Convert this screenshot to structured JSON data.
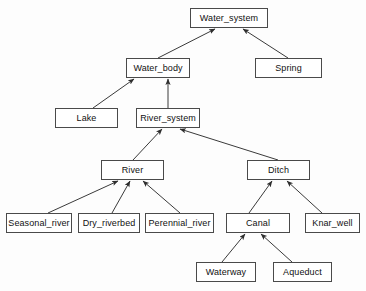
{
  "diagram": {
    "type": "hierarchy-tree",
    "background_color": "#fdfdfd",
    "box_fill_color": "#ffffff",
    "box_border_color": "#4a4a4a",
    "edge_color": "#3a3a3a",
    "text_color": "#111111",
    "arrow_direction": "child-to-parent",
    "nodes": [
      {
        "id": "water_system",
        "label": "Water_system",
        "x": 190,
        "y": 8,
        "w": 78,
        "h": 20,
        "level": 0
      },
      {
        "id": "water_body",
        "label": "Water_body",
        "x": 126,
        "y": 58,
        "w": 64,
        "h": 20,
        "level": 1
      },
      {
        "id": "spring",
        "label": "Spring",
        "x": 255,
        "y": 58,
        "w": 67,
        "h": 20,
        "level": 1
      },
      {
        "id": "lake",
        "label": "Lake",
        "x": 55,
        "y": 108,
        "w": 63,
        "h": 20,
        "level": 2
      },
      {
        "id": "river_system",
        "label": "River_system",
        "x": 136,
        "y": 108,
        "w": 64,
        "h": 20,
        "level": 2
      },
      {
        "id": "river",
        "label": "River",
        "x": 101,
        "y": 160,
        "w": 63,
        "h": 20,
        "level": 3
      },
      {
        "id": "ditch",
        "label": "Ditch",
        "x": 247,
        "y": 160,
        "w": 63,
        "h": 20,
        "level": 3
      },
      {
        "id": "seasonal_river",
        "label": "Seasonal_river",
        "x": 6,
        "y": 213,
        "w": 66,
        "h": 20,
        "level": 4
      },
      {
        "id": "dry_riverbed",
        "label": "Dry_riverbed",
        "x": 78,
        "y": 213,
        "w": 62,
        "h": 20,
        "level": 4
      },
      {
        "id": "perennial_river",
        "label": "Perennial_river",
        "x": 145,
        "y": 213,
        "w": 69,
        "h": 20,
        "level": 4
      },
      {
        "id": "canal",
        "label": "Canal",
        "x": 226,
        "y": 213,
        "w": 64,
        "h": 20,
        "level": 4
      },
      {
        "id": "knar_well",
        "label": "Knar_well",
        "x": 305,
        "y": 213,
        "w": 55,
        "h": 20,
        "level": 4
      },
      {
        "id": "waterway",
        "label": "Waterway",
        "x": 196,
        "y": 262,
        "w": 60,
        "h": 20,
        "level": 5
      },
      {
        "id": "aqueduct",
        "label": "Aqueduct",
        "x": 273,
        "y": 262,
        "w": 59,
        "h": 20,
        "level": 5
      }
    ],
    "edges": [
      {
        "from": "water_body",
        "to": "water_system",
        "x1": 158,
        "y1": 58,
        "x2": 215,
        "y2": 29
      },
      {
        "from": "spring",
        "to": "water_system",
        "x1": 288,
        "y1": 58,
        "x2": 243,
        "y2": 29
      },
      {
        "from": "lake",
        "to": "water_body",
        "x1": 93,
        "y1": 108,
        "x2": 134,
        "y2": 79
      },
      {
        "from": "river_system",
        "to": "water_body",
        "x1": 168,
        "y1": 108,
        "x2": 168,
        "y2": 79
      },
      {
        "from": "river",
        "to": "river_system",
        "x1": 133,
        "y1": 160,
        "x2": 162,
        "y2": 129
      },
      {
        "from": "ditch",
        "to": "river_system",
        "x1": 278,
        "y1": 160,
        "x2": 180,
        "y2": 129
      },
      {
        "from": "seasonal_river",
        "to": "river",
        "x1": 48,
        "y1": 213,
        "x2": 118,
        "y2": 181
      },
      {
        "from": "dry_riverbed",
        "to": "river",
        "x1": 112,
        "y1": 213,
        "x2": 130,
        "y2": 181
      },
      {
        "from": "perennial_river",
        "to": "river",
        "x1": 180,
        "y1": 213,
        "x2": 143,
        "y2": 181
      },
      {
        "from": "canal",
        "to": "ditch",
        "x1": 249,
        "y1": 213,
        "x2": 272,
        "y2": 181
      },
      {
        "from": "knar_well",
        "to": "ditch",
        "x1": 322,
        "y1": 213,
        "x2": 287,
        "y2": 181
      },
      {
        "from": "waterway",
        "to": "canal",
        "x1": 222,
        "y1": 262,
        "x2": 245,
        "y2": 234
      },
      {
        "from": "aqueduct",
        "to": "canal",
        "x1": 292,
        "y1": 262,
        "x2": 261,
        "y2": 234
      }
    ]
  }
}
